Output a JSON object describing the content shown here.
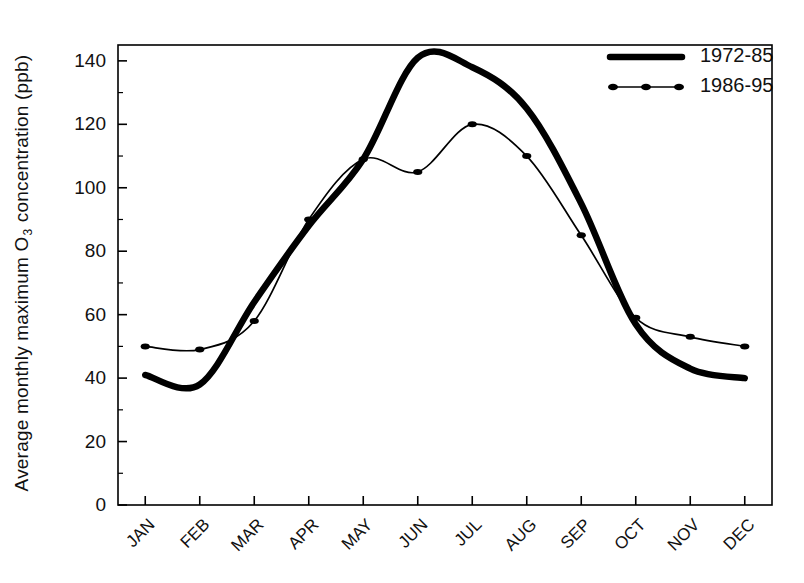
{
  "chart_data": {
    "type": "line",
    "title": "",
    "xlabel": "",
    "ylabel": "Average monthly maximum O3 concentration (ppb)",
    "ylabel_parts": {
      "before": "Average monthly maximum O",
      "subscript": "3",
      "after": " concentration (ppb)"
    },
    "categories": [
      "JAN",
      "FEB",
      "MAR",
      "APR",
      "MAY",
      "JUN",
      "JUL",
      "AUG",
      "SEP",
      "OCT",
      "NOV",
      "DEC"
    ],
    "series": [
      {
        "name": "1972-85",
        "style": "thick-solid",
        "markers": false,
        "color": "#000000",
        "values": [
          41,
          38,
          64,
          88,
          109,
          141,
          138,
          125,
          95,
          57,
          43,
          40
        ]
      },
      {
        "name": "1986-95",
        "style": "thin-solid",
        "markers": true,
        "color": "#000000",
        "values": [
          50,
          49,
          58,
          90,
          109,
          105,
          120,
          110,
          85,
          59,
          53,
          50
        ]
      }
    ],
    "ylim": [
      0,
      145
    ],
    "yticks": [
      0,
      20,
      40,
      60,
      80,
      100,
      120,
      140
    ],
    "ytick_labels": [
      "0",
      "20",
      "40",
      "60",
      "80",
      "100",
      "120",
      "140"
    ],
    "yminor_step": 10,
    "grid": false,
    "legend_position": "top-right",
    "frame": "box"
  },
  "legend": {
    "entries": [
      {
        "label": "1972-85",
        "swatch": "thick-line-swatch"
      },
      {
        "label": "1986-95",
        "swatch": "thin-line-marker-swatch"
      }
    ]
  }
}
